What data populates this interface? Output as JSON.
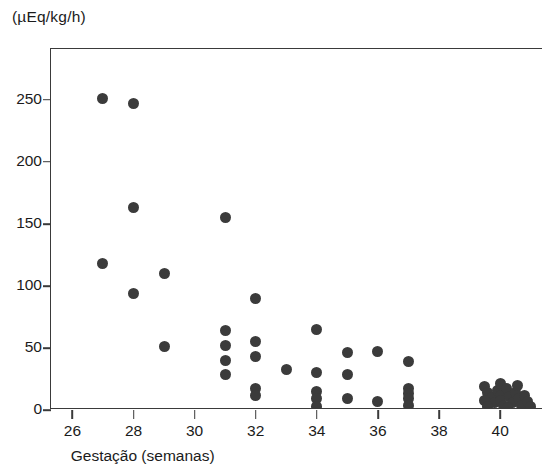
{
  "chart_data": {
    "type": "scatter",
    "title": "",
    "ylabel": "(µEq/kg/h)",
    "xlabel": "Gestação (semanas)",
    "xlim": [
      25.3,
      41.4
    ],
    "ylim": [
      0,
      291
    ],
    "xticks": [
      26,
      28,
      30,
      32,
      34,
      36,
      38,
      40
    ],
    "yticks": [
      0,
      50,
      100,
      150,
      200,
      250
    ],
    "grid": false,
    "legend": null,
    "marker": {
      "shape": "circle",
      "color": "#3b3b3b",
      "size": 11
    },
    "points": [
      {
        "x": 27.0,
        "y": 251
      },
      {
        "x": 28.0,
        "y": 247
      },
      {
        "x": 28.0,
        "y": 163
      },
      {
        "x": 27.0,
        "y": 118
      },
      {
        "x": 28.0,
        "y": 94
      },
      {
        "x": 29.0,
        "y": 110
      },
      {
        "x": 29.0,
        "y": 51
      },
      {
        "x": 31.0,
        "y": 155
      },
      {
        "x": 32.0,
        "y": 90
      },
      {
        "x": 31.0,
        "y": 64
      },
      {
        "x": 32.0,
        "y": 55
      },
      {
        "x": 31.0,
        "y": 52
      },
      {
        "x": 32.0,
        "y": 43
      },
      {
        "x": 31.0,
        "y": 40
      },
      {
        "x": 31.0,
        "y": 29
      },
      {
        "x": 32.0,
        "y": 17
      },
      {
        "x": 32.0,
        "y": 12
      },
      {
        "x": 33.0,
        "y": 33
      },
      {
        "x": 34.0,
        "y": 65
      },
      {
        "x": 34.0,
        "y": 30
      },
      {
        "x": 34.0,
        "y": 15
      },
      {
        "x": 34.0,
        "y": 9
      },
      {
        "x": 34.0,
        "y": 3
      },
      {
        "x": 35.0,
        "y": 46
      },
      {
        "x": 35.0,
        "y": 29
      },
      {
        "x": 35.0,
        "y": 9
      },
      {
        "x": 36.0,
        "y": 47
      },
      {
        "x": 36.0,
        "y": 7
      },
      {
        "x": 37.0,
        "y": 39
      },
      {
        "x": 37.0,
        "y": 17
      },
      {
        "x": 37.0,
        "y": 13
      },
      {
        "x": 37.0,
        "y": 9
      },
      {
        "x": 37.0,
        "y": 4
      },
      {
        "x": 39.5,
        "y": 19
      },
      {
        "x": 39.6,
        "y": 14
      },
      {
        "x": 39.7,
        "y": 10
      },
      {
        "x": 39.8,
        "y": 6
      },
      {
        "x": 39.9,
        "y": 16
      },
      {
        "x": 40.0,
        "y": 21
      },
      {
        "x": 40.0,
        "y": 12
      },
      {
        "x": 40.0,
        "y": 8
      },
      {
        "x": 40.1,
        "y": 4
      },
      {
        "x": 40.2,
        "y": 17
      },
      {
        "x": 40.3,
        "y": 11
      },
      {
        "x": 40.4,
        "y": 6
      },
      {
        "x": 40.5,
        "y": 14
      },
      {
        "x": 40.6,
        "y": 9
      },
      {
        "x": 40.7,
        "y": 4
      },
      {
        "x": 40.8,
        "y": 12
      },
      {
        "x": 40.9,
        "y": 7
      },
      {
        "x": 41.0,
        "y": 3
      },
      {
        "x": 39.5,
        "y": 8
      },
      {
        "x": 39.6,
        "y": 3
      },
      {
        "x": 40.25,
        "y": 2
      },
      {
        "x": 40.55,
        "y": 20
      }
    ]
  }
}
